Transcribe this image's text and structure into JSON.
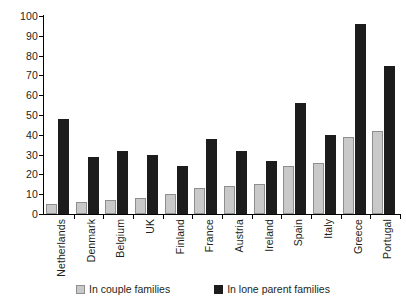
{
  "chart_data": {
    "type": "bar",
    "title": "",
    "subtitle": "",
    "xlabel": "",
    "ylabel": "",
    "ylim": [
      0,
      100
    ],
    "ytick_labels": [
      "100",
      "90",
      "80",
      "70",
      "60",
      "50",
      "40",
      "30",
      "20",
      "10",
      "0"
    ],
    "yticks": [
      100,
      90,
      80,
      70,
      60,
      50,
      40,
      30,
      20,
      10,
      0
    ],
    "grid": false,
    "legend_position": "bottom",
    "categories": [
      "Netherlands",
      "Denmark",
      "Belgium",
      "UK",
      "Finland",
      "France",
      "Austria",
      "Ireland",
      "Spain",
      "Italy",
      "Greece",
      "Portugal"
    ],
    "series": [
      {
        "name": "In couple families",
        "color": "#c9c9c9",
        "values": [
          5,
          6,
          7,
          8,
          10,
          13,
          14,
          15,
          24,
          26,
          39,
          42
        ]
      },
      {
        "name": "In lone parent families",
        "color": "#1c1c1c",
        "values": [
          48,
          29,
          32,
          30,
          24,
          38,
          32,
          27,
          56,
          40,
          96,
          75
        ]
      }
    ]
  },
  "legend": {
    "items": [
      {
        "label": "In couple families",
        "swatch": "couple"
      },
      {
        "label": "In lone parent families",
        "swatch": "lone"
      }
    ]
  }
}
